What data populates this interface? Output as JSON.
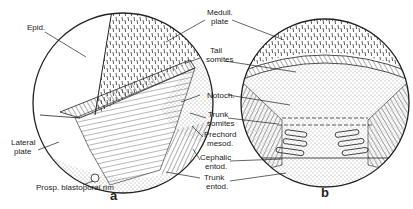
{
  "figure": {
    "panels": [
      {
        "id": "a",
        "label": "a"
      },
      {
        "id": "b",
        "label": "b"
      }
    ],
    "labels": {
      "epid": "Epid.",
      "medull_plate_1": "Medull.",
      "medull_plate_2": "plate",
      "tail_somites_1": "Tail",
      "tail_somites_2": "somites",
      "notoch": "Notoch.",
      "trunk_somites_1": "Trunk",
      "trunk_somites_2": "somites",
      "prechord_mesod_1": "Prechord",
      "prechord_mesod_2": "mesod.",
      "cephalic_entod_1": "Cephalic",
      "cephalic_entod_2": "entod.",
      "trunk_entod_1": "Trunk",
      "trunk_entod_2": "entod.",
      "lateral_plate_1": "Lateral",
      "lateral_plate_2": "plate",
      "prosp_blastoporal_rim": "Prosp. blastoporal rim"
    }
  }
}
